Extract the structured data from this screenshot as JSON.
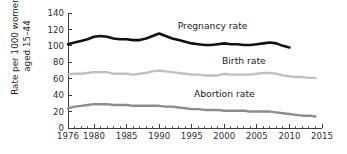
{
  "chart_data": {
    "type": "line",
    "title": "",
    "xlabel": "",
    "ylabel": "Rate per 1000 women aged 15–44",
    "xlim": [
      1976,
      2015
    ],
    "ylim": [
      0,
      140
    ],
    "grid": false,
    "legend_position": "inline-labels",
    "y_ticks": [
      0,
      20,
      40,
      60,
      80,
      100,
      120,
      140
    ],
    "y_tick_labels": [
      "0",
      "20",
      "40",
      "60",
      "80",
      "100",
      "120",
      "140"
    ],
    "x_ticks": [
      1976,
      1980,
      1985,
      1990,
      1995,
      2000,
      2005,
      2010,
      2015
    ],
    "x_tick_labels": [
      "1976",
      "1980",
      "1985",
      "1990",
      "1995",
      "2000",
      "2005",
      "2010",
      "2015"
    ],
    "x_minor_tick_step": 1,
    "series": [
      {
        "name": "Pregnancy rate",
        "color": "#111111",
        "width": 2.6,
        "label_x": 1998.2,
        "label_y": 120,
        "x": [
          1976,
          1977,
          1978,
          1979,
          1980,
          1981,
          1982,
          1983,
          1984,
          1985,
          1986,
          1987,
          1988,
          1989,
          1990,
          1991,
          1992,
          1993,
          1994,
          1995,
          1996,
          1997,
          1998,
          1999,
          2000,
          2001,
          2002,
          2003,
          2004,
          2005,
          2006,
          2007,
          2008,
          2009,
          2010
        ],
        "values": [
          102,
          104,
          106,
          108,
          111,
          112,
          111,
          109,
          108,
          108,
          107,
          107,
          109,
          112,
          115,
          112,
          109,
          107,
          105,
          103,
          102,
          101,
          101,
          102,
          103,
          102,
          102,
          101,
          101,
          102,
          103,
          104,
          103,
          100,
          98
        ]
      },
      {
        "name": "Birth rate",
        "color": "#c0c0c0",
        "width": 2.4,
        "label_x": 2003.0,
        "label_y": 78,
        "x": [
          1976,
          1977,
          1978,
          1979,
          1980,
          1981,
          1982,
          1983,
          1984,
          1985,
          1986,
          1987,
          1988,
          1989,
          1990,
          1991,
          1992,
          1993,
          1994,
          1995,
          1996,
          1997,
          1998,
          1999,
          2000,
          2001,
          2002,
          2003,
          2004,
          2005,
          2006,
          2007,
          2008,
          2009,
          2010,
          2011,
          2012,
          2013,
          2014
        ],
        "values": [
          65,
          66,
          66,
          67,
          68,
          68,
          68,
          66,
          66,
          66,
          65,
          66,
          67,
          69,
          70,
          69,
          68,
          67,
          66,
          65,
          65,
          64,
          64,
          64,
          66,
          65,
          65,
          65,
          65,
          66,
          67,
          67,
          66,
          64,
          63,
          62,
          62,
          61,
          61
        ]
      },
      {
        "name": "Abortion rate",
        "color": "#8c8c8c",
        "width": 2.4,
        "label_x": 2000.0,
        "label_y": 38,
        "x": [
          1976,
          1977,
          1978,
          1979,
          1980,
          1981,
          1982,
          1983,
          1984,
          1985,
          1986,
          1987,
          1988,
          1989,
          1990,
          1991,
          1992,
          1993,
          1994,
          1995,
          1996,
          1997,
          1998,
          1999,
          2000,
          2001,
          2002,
          2003,
          2004,
          2005,
          2006,
          2007,
          2008,
          2009,
          2010,
          2011,
          2012,
          2013,
          2014
        ],
        "values": [
          24,
          26,
          27,
          28,
          29,
          29,
          29,
          28,
          28,
          28,
          27,
          27,
          27,
          27,
          27,
          26,
          26,
          25,
          24,
          23,
          23,
          22,
          22,
          22,
          21,
          21,
          21,
          21,
          20,
          20,
          20,
          20,
          19,
          18,
          17,
          16,
          15,
          15,
          14
        ]
      }
    ]
  }
}
